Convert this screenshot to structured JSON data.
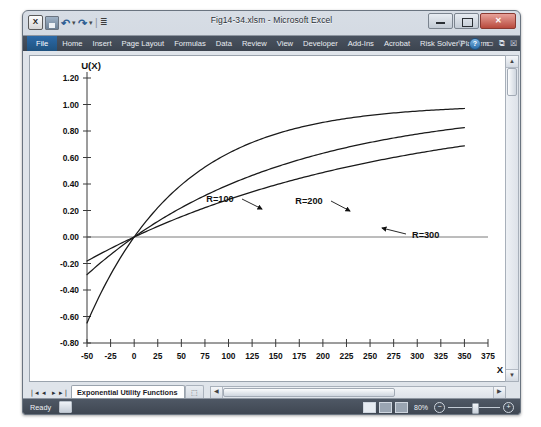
{
  "window": {
    "title": "Fig14-34.xlsm - Microsoft Excel",
    "quick_access": [
      {
        "name": "excel-logo",
        "glyph": "X"
      },
      {
        "name": "save-icon",
        "glyph": ""
      },
      {
        "name": "undo-icon",
        "glyph": "↶"
      },
      {
        "name": "redo-icon",
        "glyph": "↷"
      },
      {
        "name": "customize-qat-icon",
        "glyph": "▾"
      }
    ],
    "controls": {
      "minimize": "minimize-button",
      "restore": "restore-button",
      "close": "close-button",
      "close_glyph": "✕"
    }
  },
  "ribbon": {
    "tabs": [
      {
        "label": "File",
        "active": true
      },
      {
        "label": "Home",
        "active": false
      },
      {
        "label": "Insert",
        "active": false
      },
      {
        "label": "Page Layout",
        "active": false
      },
      {
        "label": "Formulas",
        "active": false
      },
      {
        "label": "Data",
        "active": false
      },
      {
        "label": "Review",
        "active": false
      },
      {
        "label": "View",
        "active": false
      },
      {
        "label": "Developer",
        "active": false
      },
      {
        "label": "Add-Ins",
        "active": false
      },
      {
        "label": "Acrobat",
        "active": false
      },
      {
        "label": "Risk Solver Platform",
        "active": false
      }
    ],
    "right_icons": [
      {
        "name": "ribbon-options-icon",
        "glyph": "▽"
      },
      {
        "name": "help-icon",
        "glyph": "?"
      },
      {
        "name": "minimize-ribbon-icon",
        "glyph": "▭"
      },
      {
        "name": "restore-window-icon",
        "glyph": "⧉"
      },
      {
        "name": "close-window-icon",
        "glyph": "☒"
      }
    ]
  },
  "sheet_tabs": {
    "nav": [
      "❘◂",
      "◂",
      "▸",
      "▸❘"
    ],
    "active_tab": "Exponential Utility Functions",
    "new_sheet_label": "⬚"
  },
  "status_bar": {
    "state": "Ready",
    "macro_record_icon": "record-macro-icon",
    "views": [
      "normal-view",
      "page-layout-view",
      "page-break-view"
    ],
    "zoom_level": "80%",
    "zoom_out_glyph": "−",
    "zoom_in_glyph": "+"
  },
  "chart_data": {
    "type": "line",
    "title": "",
    "xlabel": "X",
    "ylabel": "U(X)",
    "xlim": [
      -50,
      375
    ],
    "ylim": [
      -0.8,
      1.2
    ],
    "xticks": [
      -50,
      -25,
      0,
      25,
      50,
      75,
      100,
      125,
      150,
      175,
      200,
      225,
      250,
      275,
      300,
      325,
      350,
      375
    ],
    "yticks": [
      -0.8,
      -0.6,
      -0.4,
      -0.2,
      0.0,
      0.2,
      0.4,
      0.6,
      0.8,
      1.0,
      1.2
    ],
    "ytick_labels": [
      "-0.80",
      "-0.60",
      "-0.40",
      "-0.20",
      "0.00",
      "0.20",
      "0.40",
      "0.60",
      "0.80",
      "1.00",
      "1.20"
    ],
    "xtick_labels": [
      "-50",
      "-25",
      "0",
      "25",
      "50",
      "75",
      "100",
      "125",
      "150",
      "175",
      "200",
      "225",
      "250",
      "275",
      "300",
      "325",
      "350",
      "375"
    ],
    "grid": false,
    "legend": "annotations",
    "formula": "U(X) = 1 - exp(-X/R)",
    "x": [
      -50,
      -40,
      -30,
      -20,
      -10,
      0,
      10,
      20,
      30,
      40,
      50,
      75,
      100,
      125,
      150,
      175,
      200,
      225,
      250,
      275,
      300,
      325,
      350
    ],
    "series": [
      {
        "name": "R=100",
        "R": 100,
        "label": "R=100",
        "values": [
          -0.6487,
          -0.4918,
          -0.3499,
          -0.2214,
          -0.1052,
          0.0,
          0.0952,
          0.1813,
          0.2592,
          0.3297,
          0.3935,
          0.5276,
          0.6321,
          0.7135,
          0.7769,
          0.8262,
          0.8647,
          0.8946,
          0.9179,
          0.9361,
          0.9502,
          0.9612,
          0.9698
        ]
      },
      {
        "name": "R=200",
        "R": 200,
        "label": "R=200",
        "values": [
          -0.284,
          -0.2214,
          -0.1618,
          -0.1052,
          -0.0513,
          0.0,
          0.0488,
          0.0952,
          0.1393,
          0.1813,
          0.2212,
          0.3127,
          0.3935,
          0.4647,
          0.5276,
          0.5831,
          0.6321,
          0.6753,
          0.7135,
          0.7473,
          0.7769,
          0.8034,
          0.8262
        ]
      },
      {
        "name": "R=300",
        "R": 300,
        "label": "R=300",
        "values": [
          -0.1814,
          -0.1435,
          -0.1052,
          -0.069,
          -0.0339,
          0.0,
          0.0328,
          0.0645,
          0.0952,
          0.1248,
          0.1535,
          0.2212,
          0.2835,
          0.3408,
          0.3935,
          0.4421,
          0.4866,
          0.5276,
          0.5654,
          0.6002,
          0.6321,
          0.6615,
          0.6886
        ]
      }
    ],
    "annotations": [
      {
        "text": "R=100",
        "target_series": "R=100"
      },
      {
        "text": "R=200",
        "target_series": "R=200"
      },
      {
        "text": "R=300",
        "target_series": "R=300"
      }
    ]
  }
}
